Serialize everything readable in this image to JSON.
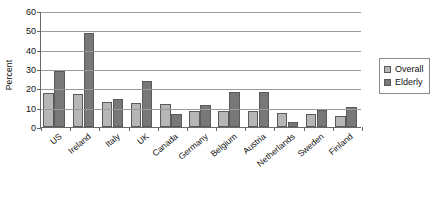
{
  "chart_data": {
    "type": "bar",
    "title": "",
    "xlabel": "",
    "ylabel": "Percent",
    "ylim": [
      0,
      60
    ],
    "yticks": [
      0,
      10,
      20,
      30,
      40,
      50,
      60
    ],
    "ytick_labels": [
      "0",
      "10",
      "20",
      "30",
      "40",
      "50",
      "60"
    ],
    "grid": true,
    "legend_position": "right",
    "categories": [
      "US",
      "Ireland",
      "Italy",
      "UK",
      "Canada",
      "Germany",
      "Belgium",
      "Austria",
      "Netherlands",
      "Sweden",
      "Finland"
    ],
    "series": [
      {
        "name": "Overall",
        "color": "#b6b6b6",
        "values": [
          17.5,
          17,
          13,
          12.5,
          12,
          8.5,
          8.5,
          8.5,
          7.5,
          6.5,
          5.5
        ]
      },
      {
        "name": "Elderly",
        "color": "#787878",
        "values": [
          29,
          48.5,
          14.5,
          24,
          6.5,
          11.5,
          18,
          18,
          2.5,
          9,
          10.5
        ]
      }
    ]
  },
  "legend": {
    "items": [
      {
        "label": "Overall",
        "swatch": "overall"
      },
      {
        "label": "Elderly",
        "swatch": "elderly"
      }
    ]
  },
  "axes": {
    "y_title": "Percent"
  }
}
